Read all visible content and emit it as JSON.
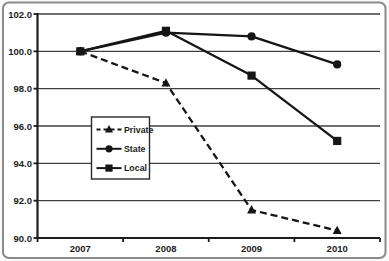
{
  "window": {
    "background": "#ffffff",
    "outer_background": "#fafafa",
    "frame_border_color": "#8a8a8a"
  },
  "chart_data": {
    "type": "line",
    "title": "",
    "xlabel": "",
    "ylabel": "",
    "categories": [
      "2007",
      "2008",
      "2009",
      "2010"
    ],
    "series": [
      {
        "name": "Private",
        "values": [
          100.0,
          98.3,
          91.5,
          90.4
        ],
        "marker": "triangle",
        "line_style": "dashed"
      },
      {
        "name": "State",
        "values": [
          100.0,
          101.0,
          100.8,
          99.3
        ],
        "marker": "circle",
        "line_style": "solid"
      },
      {
        "name": "Local",
        "values": [
          100.0,
          101.1,
          98.7,
          95.2
        ],
        "marker": "square",
        "line_style": "solid"
      }
    ],
    "ylim": [
      90.0,
      102.0
    ],
    "ytick_step": 2.0,
    "ytick_labels": [
      "90.0",
      "92.0",
      "94.0",
      "96.0",
      "98.0",
      "100.0",
      "102.0"
    ],
    "grid": true,
    "legend_position": "inside-left",
    "legend_order": [
      "Private",
      "State",
      "Local"
    ],
    "series_color": "#161616",
    "axis_color": "#1c1c1c",
    "gridline_color": "#404040",
    "text_color": "#1c1c1c",
    "plot_background": "#ffffff"
  }
}
